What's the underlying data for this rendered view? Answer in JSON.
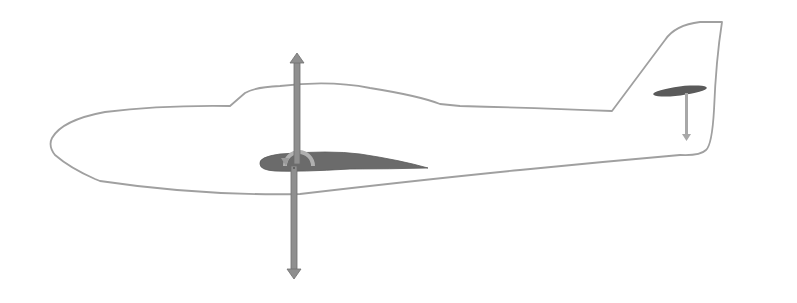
{
  "diagram": {
    "title": "",
    "type": "aircraft-forces-side-view",
    "colors": {
      "background": "#ffffff",
      "fuselage_outline": "#a0a0a0",
      "wing_fill": "#6b6b6b",
      "force_arrow": "#8f8f8f",
      "force_arrow_stroke": "#6e6e6e",
      "moment_arc": "#b0b0b0",
      "tail_arrow": "#a8a8a8"
    },
    "elements": [
      {
        "id": "fuselage",
        "label": "Fuselage outline"
      },
      {
        "id": "main-wing",
        "label": "Main wing airfoil"
      },
      {
        "id": "lift-arrow",
        "label": "Lift (up)"
      },
      {
        "id": "weight-arrow",
        "label": "Weight (down)"
      },
      {
        "id": "pitching-moment",
        "label": "Pitching moment arc"
      },
      {
        "id": "horizontal-stabilizer",
        "label": "Horizontal stabilizer"
      },
      {
        "id": "tail-downforce-arrow",
        "label": "Tail downforce (down)"
      }
    ]
  }
}
